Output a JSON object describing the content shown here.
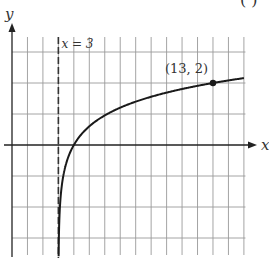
{
  "chart_data": {
    "type": "line",
    "title": "",
    "panel_label": "( )",
    "xlabel": "x",
    "ylabel": "y",
    "xlim": [
      0,
      15
    ],
    "ylim": [
      -3.6,
      3.5
    ],
    "x_grid_step": 1,
    "y_grid_step": 1,
    "grid": true,
    "tick_labels_shown": false,
    "function": "y = 2·log10(x − 3)",
    "series": [
      {
        "name": "curve",
        "x": [
          3.016,
          3.03,
          3.06,
          3.1,
          3.2,
          3.4,
          3.6,
          4,
          4.5,
          5,
          6,
          7,
          8,
          9,
          10,
          11,
          12,
          13,
          14,
          15
        ],
        "y": [
          -3.6,
          -3.05,
          -2.44,
          -2.0,
          -1.4,
          -0.8,
          -0.44,
          0,
          0.35,
          0.6,
          0.95,
          1.2,
          1.4,
          1.56,
          1.69,
          1.81,
          1.91,
          2.0,
          2.08,
          2.16
        ]
      }
    ],
    "asymptote": {
      "x": 3,
      "label": "x = 3",
      "style": "dashed"
    },
    "annotations": [
      {
        "label": "(13, 2)",
        "x": 13,
        "y": 2,
        "marker": "filled-dot"
      }
    ]
  }
}
